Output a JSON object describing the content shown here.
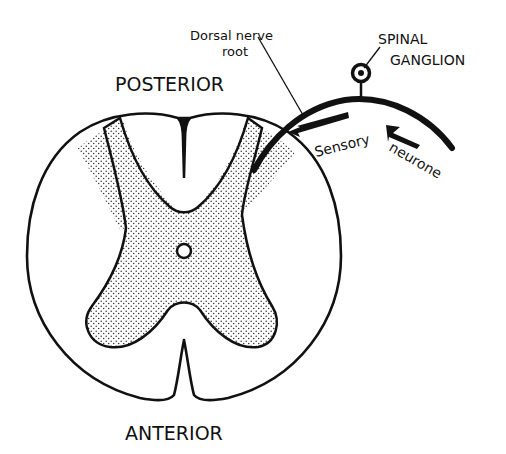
{
  "diagram": {
    "labels": {
      "posterior": "POSTERIOR",
      "anterior": "ANTERIOR",
      "dorsal_line1": "Dorsal nerve",
      "dorsal_line2": "root",
      "ganglion_line1": "SPINAL",
      "ganglion_line2": "GANGLION",
      "sensory": "Sensory",
      "neurone": "neurone"
    },
    "colors": {
      "ink": "#111111",
      "grey_matter_fill": "#e8e8e8",
      "background": "#ffffff"
    }
  }
}
